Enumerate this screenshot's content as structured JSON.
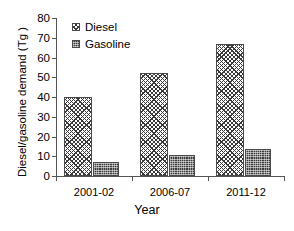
{
  "chart_data": {
    "type": "bar",
    "title": "",
    "xlabel": "Year",
    "ylabel": "Diesel/gasoline demand (Tg )",
    "categories": [
      "2001-02",
      "2006-07",
      "2011-12"
    ],
    "series": [
      {
        "name": "Diesel",
        "values": [
          40,
          52,
          67
        ],
        "pattern": "cross-hatch",
        "color": "#ffffff"
      },
      {
        "name": "Gasoline",
        "values": [
          7,
          10.5,
          13.5
        ],
        "pattern": "dense-dot",
        "color": "#3b3b3b"
      }
    ],
    "ylim": [
      0,
      80
    ],
    "ytick_step": 10,
    "yticks": [
      "0",
      "10",
      "20",
      "30",
      "40",
      "50",
      "60",
      "70",
      "80"
    ],
    "grid": false,
    "legend_position": "top-left-inside"
  },
  "legend": {
    "entries": [
      {
        "label": "Diesel"
      },
      {
        "label": "Gasoline"
      }
    ]
  },
  "axes": {
    "y_title": "Diesel/gasoline demand (Tg )",
    "x_title": "Year"
  }
}
